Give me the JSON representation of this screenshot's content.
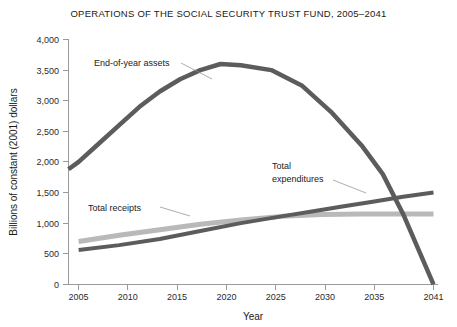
{
  "chart_data": {
    "type": "line",
    "title": "OPERATIONS OF THE SOCIAL SECURITY TRUST FUND, 2005–2041",
    "xlabel": "Year",
    "ylabel": "Billions of constant (2001) dollars",
    "xlim": [
      2005,
      2041
    ],
    "ylim": [
      0,
      4000
    ],
    "grid": false,
    "legend_position": "inline-annotations",
    "x_tick_labels": [
      "2005",
      "2010",
      "2015",
      "2020",
      "2025",
      "2030",
      "2035",
      "2041"
    ],
    "x_ticks": [
      2005,
      2010,
      2015,
      2020,
      2025,
      2030,
      2035,
      2041
    ],
    "y_tick_labels": [
      "0",
      "500",
      "1,000",
      "1,500",
      "2,000",
      "2,500",
      "3,000",
      "3,500",
      "4,000"
    ],
    "y_ticks": [
      0,
      500,
      1000,
      1500,
      2000,
      2500,
      3000,
      3500,
      4000
    ],
    "series": [
      {
        "name": "End-of-year assets",
        "color": "#5c5c5c",
        "x": [
          2005,
          2006,
          2008,
          2010,
          2012,
          2014,
          2016,
          2018,
          2020,
          2022,
          2025,
          2028,
          2031,
          2034,
          2036,
          2038,
          2041
        ],
        "values": [
          1880,
          2000,
          2300,
          2600,
          2900,
          3150,
          3350,
          3500,
          3600,
          3580,
          3500,
          3250,
          2800,
          2250,
          1800,
          1150,
          0
        ]
      },
      {
        "name": "Total receipts",
        "color": "#b9b9b9",
        "x": [
          2006,
          2010,
          2014,
          2018,
          2022,
          2026,
          2030,
          2034,
          2038,
          2041
        ],
        "values": [
          700,
          800,
          890,
          980,
          1050,
          1110,
          1140,
          1150,
          1150,
          1150
        ]
      },
      {
        "name": "Total expenditures",
        "color": "#5c5c5c",
        "x": [
          2006,
          2010,
          2014,
          2018,
          2022,
          2026,
          2029,
          2032,
          2035,
          2038,
          2041
        ],
        "values": [
          560,
          640,
          740,
          870,
          1000,
          1110,
          1190,
          1270,
          1350,
          1430,
          1500
        ]
      }
    ],
    "annotations": [
      {
        "text": "End-of-year assets",
        "target_series": "End-of-year assets"
      },
      {
        "text": "Total",
        "target_series": "Total expenditures"
      },
      {
        "text": "expenditures",
        "target_series": "Total expenditures"
      },
      {
        "text": "Total receipts",
        "target_series": "Total receipts"
      }
    ]
  },
  "colors": {
    "assets": "#5c5c5c",
    "receipts": "#b9b9b9",
    "expenditures": "#5c5c5c",
    "axis": "#9a9a9a",
    "text": "#1a1a1a"
  }
}
